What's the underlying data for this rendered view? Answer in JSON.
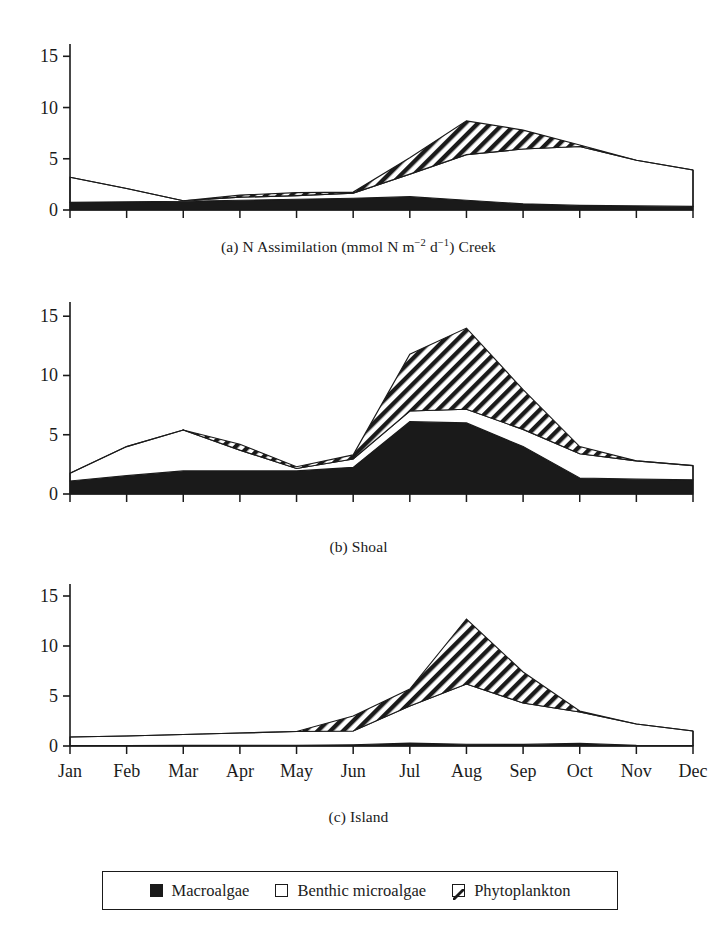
{
  "figure": {
    "y_axis": {
      "ticks": [
        0,
        5,
        10,
        15
      ],
      "min": 0,
      "max": 16.2
    },
    "x_axis": {
      "ticks": [
        "Jan",
        "Feb",
        "Mar",
        "Apr",
        "May",
        "Jun",
        "Jul",
        "Aug",
        "Sep",
        "Oct",
        "Nov",
        "Dec"
      ]
    },
    "captions": {
      "a_prefix": "(a) N Assimilation (mmol N m",
      "a_sup1": "−2",
      "a_mid": " d",
      "a_sup2": "−1",
      "a_suffix": ") Creek",
      "b": "(b) Shoal",
      "c": "(c) Island"
    }
  },
  "legend": {
    "entries": [
      {
        "label": "Macroalgae",
        "swatch": "solid-black-square-icon"
      },
      {
        "label": "Benthic microalgae",
        "swatch": "open-white-square-icon"
      },
      {
        "label": "Phytoplankton",
        "swatch": "diagonal-hatch-square-icon"
      }
    ]
  },
  "colors": {
    "macroalgae_fill": "#1a1a1a",
    "benthic_fill": "#ffffff",
    "phytoplankton_fill": "#ffffff",
    "hatch_stroke": "#1a1a1a",
    "axis": "#1a1a1a",
    "background": "#ffffff"
  },
  "chart_data": [
    {
      "type": "area",
      "id": "creek",
      "title": "(a) N Assimilation (mmol N m−2 d−1) Creek",
      "stacked": true,
      "xlabel": "",
      "ylabel": "",
      "ylim": [
        0,
        16.2
      ],
      "grid": false,
      "categories": [
        "Jan",
        "Feb",
        "Mar",
        "Apr",
        "May",
        "Jun",
        "Jul",
        "Aug",
        "Sep",
        "Oct",
        "Nov",
        "Dec"
      ],
      "series": [
        {
          "name": "Macroalgae",
          "values": [
            0.75,
            0.8,
            0.85,
            0.95,
            1.05,
            1.15,
            1.3,
            0.95,
            0.6,
            0.45,
            0.4,
            0.35
          ]
        },
        {
          "name": "Benthic microalgae",
          "values": [
            2.45,
            1.3,
            0.05,
            0.3,
            0.35,
            0.5,
            2.2,
            4.45,
            5.35,
            5.75,
            4.45,
            3.55
          ]
        },
        {
          "name": "Phytoplankton",
          "values": [
            0.0,
            0.0,
            0.0,
            0.2,
            0.3,
            0.1,
            1.6,
            3.3,
            1.85,
            0.15,
            0.0,
            0.0
          ]
        }
      ],
      "totals": [
        3.2,
        2.1,
        0.9,
        1.45,
        1.7,
        1.75,
        5.1,
        8.7,
        7.8,
        6.35,
        4.85,
        3.9
      ]
    },
    {
      "type": "area",
      "id": "shoal",
      "title": "(b) Shoal",
      "stacked": true,
      "xlabel": "",
      "ylabel": "",
      "ylim": [
        0,
        16.2
      ],
      "grid": false,
      "categories": [
        "Jan",
        "Feb",
        "Mar",
        "Apr",
        "May",
        "Jun",
        "Jul",
        "Aug",
        "Sep",
        "Oct",
        "Nov",
        "Dec"
      ],
      "series": [
        {
          "name": "Macroalgae",
          "values": [
            1.1,
            1.55,
            1.95,
            1.95,
            1.95,
            2.25,
            6.1,
            6.0,
            4.0,
            1.35,
            1.25,
            1.2
          ]
        },
        {
          "name": "Benthic microalgae",
          "values": [
            0.65,
            2.45,
            3.45,
            1.75,
            0.2,
            0.7,
            0.9,
            1.15,
            1.45,
            2.05,
            1.55,
            1.2
          ]
        },
        {
          "name": "Phytoplankton",
          "values": [
            0.0,
            0.0,
            0.0,
            0.5,
            0.15,
            0.35,
            4.8,
            6.85,
            3.35,
            0.6,
            0.0,
            0.0
          ]
        }
      ],
      "totals": [
        1.75,
        4.0,
        5.4,
        4.2,
        2.3,
        3.3,
        11.8,
        14.0,
        8.8,
        4.0,
        2.8,
        2.4
      ]
    },
    {
      "type": "area",
      "id": "island",
      "title": "(c) Island",
      "stacked": true,
      "xlabel": "",
      "ylabel": "",
      "ylim": [
        0,
        16.2
      ],
      "grid": false,
      "categories": [
        "Jan",
        "Feb",
        "Mar",
        "Apr",
        "May",
        "Jun",
        "Jul",
        "Aug",
        "Sep",
        "Oct",
        "Nov",
        "Dec"
      ],
      "series": [
        {
          "name": "Macroalgae",
          "values": [
            0.05,
            0.05,
            0.06,
            0.07,
            0.08,
            0.12,
            0.28,
            0.18,
            0.16,
            0.26,
            0.07,
            0.05
          ]
        },
        {
          "name": "Benthic microalgae",
          "values": [
            0.85,
            0.95,
            1.09,
            1.23,
            1.37,
            1.38,
            3.72,
            6.02,
            4.14,
            3.14,
            2.13,
            1.45
          ]
        },
        {
          "name": "Phytoplankton",
          "values": [
            0.0,
            0.0,
            0.0,
            0.0,
            0.0,
            1.5,
            1.7,
            6.5,
            3.1,
            0.1,
            0.0,
            0.0
          ]
        }
      ],
      "totals": [
        0.9,
        1.0,
        1.15,
        1.3,
        1.45,
        3.0,
        5.7,
        12.7,
        7.4,
        3.5,
        2.2,
        1.5
      ]
    }
  ]
}
